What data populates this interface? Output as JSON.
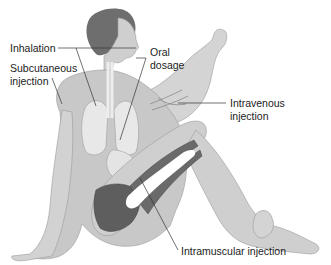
{
  "diagram": {
    "labels": {
      "inhalation": "Inhalation",
      "oral_line1": "Oral",
      "oral_line2": "dosage",
      "subcutaneous_line1": "Subcutaneous",
      "subcutaneous_line2": "injection",
      "intravenous_line1": "Intravenous",
      "intravenous_line2": "injection",
      "intramuscular": "Intramuscular injection"
    },
    "colors": {
      "skin": "#c8c8c8",
      "skin_light": "#dcdcdc",
      "outline": "#9a9a9a",
      "hair": "#6e6e6e",
      "organs": "#e8e8e8",
      "muscle": "#5e5e5e",
      "muscle_light": "#8a8a8a",
      "text": "#222222",
      "leader": "#333333"
    }
  }
}
